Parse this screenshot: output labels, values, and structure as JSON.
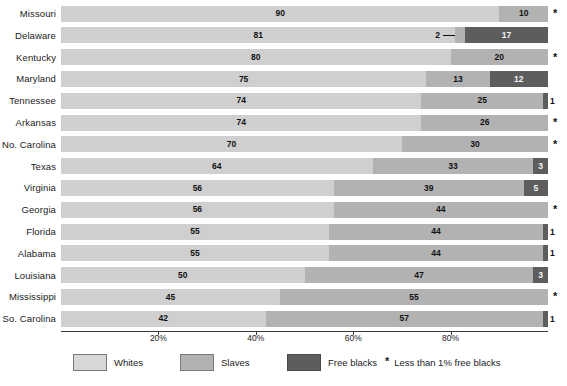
{
  "chart_data": {
    "type": "bar",
    "subtype": "stacked-horizontal-bar",
    "title": "",
    "xlabel": "",
    "ylabel": "",
    "xlim": [
      0,
      100
    ],
    "grid": false,
    "legend_position": "bottom",
    "categories": [
      "Missouri",
      "Delaware",
      "Kentucky",
      "Maryland",
      "Tennessee",
      "Arkansas",
      "No. Carolina",
      "Texas",
      "Virginia",
      "Georgia",
      "Florida",
      "Alabama",
      "Louisiana",
      "Mississippi",
      "So. Carolina"
    ],
    "series": [
      {
        "name": "Whites",
        "values": [
          90,
          81,
          80,
          75,
          74,
          74,
          70,
          64,
          56,
          56,
          55,
          55,
          50,
          45,
          42
        ]
      },
      {
        "name": "Slaves",
        "values": [
          10,
          2,
          20,
          13,
          25,
          26,
          30,
          33,
          39,
          44,
          44,
          44,
          47,
          55,
          57
        ]
      },
      {
        "name": "Free blacks",
        "values": [
          0,
          17,
          0,
          12,
          1,
          0,
          0,
          3,
          5,
          0,
          1,
          1,
          3,
          0,
          1
        ]
      }
    ],
    "tick_labels": [
      "20%",
      "40%",
      "60%",
      "80%"
    ],
    "tick_values": [
      20,
      40,
      60,
      80
    ],
    "annotations": {
      "asterisk_rows": [
        "Missouri",
        "Kentucky",
        "Arkansas",
        "No. Carolina",
        "Georgia",
        "Mississippi"
      ],
      "delaware_callout": "2",
      "footnote": "Less than 1% free blacks",
      "asterisk_glyph": "*"
    },
    "colors": {
      "whites": "#cfcfcf",
      "slaves": "#b2b2b2",
      "free_blacks": "#5d5d5d",
      "axis": "#3a3a3a",
      "text": "#1b1b1b",
      "background": "#ffffff"
    }
  },
  "rows": [
    {
      "state": "Missouri",
      "whites": 90,
      "slaves": 10,
      "free": 0,
      "star": true,
      "free_outside": false
    },
    {
      "state": "Delaware",
      "whites": 81,
      "slaves": 2,
      "free": 17,
      "star": false,
      "free_outside": false,
      "callout": "2"
    },
    {
      "state": "Kentucky",
      "whites": 80,
      "slaves": 20,
      "free": 0,
      "star": true,
      "free_outside": false
    },
    {
      "state": "Maryland",
      "whites": 75,
      "slaves": 13,
      "free": 12,
      "star": false,
      "free_outside": false
    },
    {
      "state": "Tennessee",
      "whites": 74,
      "slaves": 25,
      "free": 1,
      "star": false,
      "free_outside": true
    },
    {
      "state": "Arkansas",
      "whites": 74,
      "slaves": 26,
      "free": 0,
      "star": true,
      "free_outside": false
    },
    {
      "state": "No. Carolina",
      "whites": 70,
      "slaves": 30,
      "free": 0,
      "star": true,
      "free_outside": false
    },
    {
      "state": "Texas",
      "whites": 64,
      "slaves": 33,
      "free": 3,
      "star": false,
      "free_outside": false
    },
    {
      "state": "Virginia",
      "whites": 56,
      "slaves": 39,
      "free": 5,
      "star": false,
      "free_outside": false
    },
    {
      "state": "Georgia",
      "whites": 56,
      "slaves": 44,
      "free": 0,
      "star": true,
      "free_outside": false
    },
    {
      "state": "Florida",
      "whites": 55,
      "slaves": 44,
      "free": 1,
      "star": false,
      "free_outside": true
    },
    {
      "state": "Alabama",
      "whites": 55,
      "slaves": 44,
      "free": 1,
      "star": false,
      "free_outside": true
    },
    {
      "state": "Louisiana",
      "whites": 50,
      "slaves": 47,
      "free": 3,
      "star": false,
      "free_outside": false
    },
    {
      "state": "Mississippi",
      "whites": 45,
      "slaves": 55,
      "free": 0,
      "star": true,
      "free_outside": false
    },
    {
      "state": "So. Carolina",
      "whites": 42,
      "slaves": 57,
      "free": 1,
      "star": false,
      "free_outside": true
    }
  ],
  "legend": {
    "items": [
      {
        "label": "Whites",
        "key": "whites"
      },
      {
        "label": "Slaves",
        "key": "slaves"
      },
      {
        "label": "Free blacks",
        "key": "free"
      }
    ],
    "footnote_marker": "*",
    "footnote_text": "Less than 1% free blacks"
  }
}
